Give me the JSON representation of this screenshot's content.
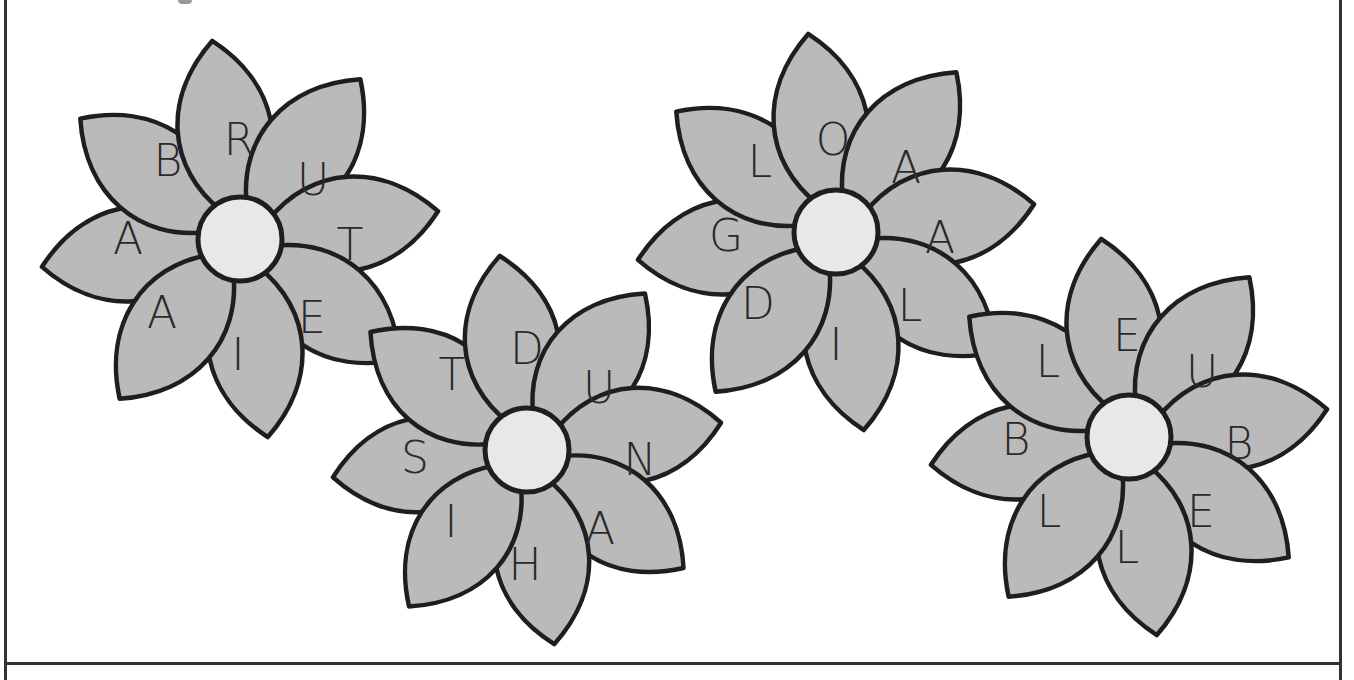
{
  "puzzle": {
    "type": "anagram-flower-wordsearch",
    "colors": {
      "petal_fill": "#bababa",
      "outline": "#1e1e1e",
      "center_fill": "#e8e8e8",
      "letter": "#2a2a2a",
      "background": "#ffffff"
    },
    "flowers": [
      {
        "id": "flower-1",
        "center": [
          240,
          239
        ],
        "letters": [
          "R",
          "U",
          "T",
          "E",
          "I",
          "A",
          "A",
          "B"
        ]
      },
      {
        "id": "flower-2",
        "center": [
          527,
          450
        ],
        "letters": [
          "D",
          "U",
          "N",
          "A",
          "H",
          "I",
          "S",
          "T"
        ]
      },
      {
        "id": "flower-3",
        "center": [
          836,
          232
        ],
        "letters": [
          "O",
          "A",
          "A",
          "L",
          "I",
          "D",
          "G",
          "L"
        ]
      },
      {
        "id": "flower-4",
        "center": [
          1129,
          437
        ],
        "letters": [
          "E",
          "U",
          "B",
          "E",
          "L",
          "L",
          "B",
          "L"
        ]
      }
    ]
  }
}
